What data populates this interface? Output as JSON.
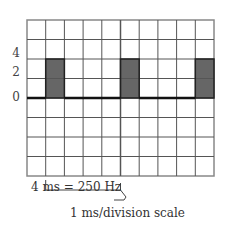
{
  "diagram": {
    "type": "oscilloscope-square-wave",
    "grid": {
      "columns": 10,
      "rows": 8
    },
    "y_axis_labels": [
      "4",
      "2",
      "0"
    ],
    "pulses": [
      {
        "column": 1,
        "height_divisions": 2
      },
      {
        "column": 5,
        "height_divisions": 2
      },
      {
        "column": 9,
        "height_divisions": 2
      }
    ],
    "period_bracket_label": "4 ms = 250 Hz",
    "scale_label": "1 ms/division scale",
    "colors": {
      "grid": "#555555",
      "pulse_fill": "#666666",
      "baseline": "#111111"
    }
  }
}
